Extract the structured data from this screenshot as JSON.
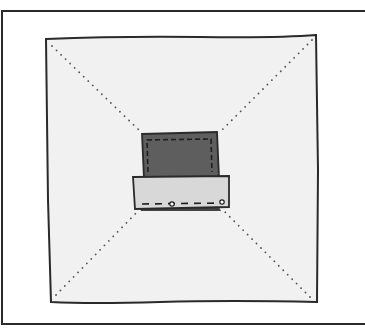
{
  "diagram": {
    "type": "sewing-illustration",
    "colors": {
      "background": "#ffffff",
      "frame": "#2a2a2a",
      "fabric": "#f1f1f1",
      "pocket_back": "#5e5e5e",
      "pocket_flap": "#d8d8d8",
      "stitch": "#1e1e1e",
      "fold_dots": "#555555"
    },
    "elements": {
      "outer_frame": "frame",
      "fabric_square": "fabric",
      "fold_lines": "diagonal dotted fold lines",
      "pocket_back": "dark back panel with dashed stitching",
      "pocket_flap": "light flap with dashed stitching and two pins"
    }
  }
}
